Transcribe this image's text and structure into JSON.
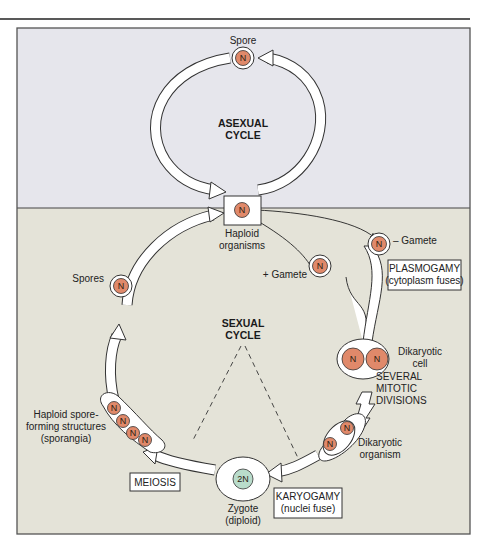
{
  "colors": {
    "asexual_bg": "#e6e6ec",
    "sexual_bg": "#e4e3d8",
    "nucleus_haploid": "#e0896a",
    "nucleus_diploid": "#b9dccb",
    "frame": "#444444"
  },
  "asexual": {
    "title_line1": "ASEXUAL",
    "title_line2": "CYCLE",
    "spore_label": "Spore",
    "spore_nucleus": "N"
  },
  "haploid": {
    "nucleus": "N",
    "label_line1": "Haploid",
    "label_line2": "organisms"
  },
  "gametes": {
    "minus_label": "– Gamete",
    "plus_label": "+ Gamete",
    "nucleus": "N"
  },
  "plasmogamy": {
    "title": "PLASMOGAMY",
    "subtitle": "(cytoplasm fuses)"
  },
  "dikaryotic_cell": {
    "nuclei": [
      "N",
      "N"
    ],
    "label_line1": "Dikaryotic",
    "label_line2": "cell"
  },
  "mitotic": {
    "line1": "SEVERAL",
    "line2": "MITOTIC",
    "line3": "DIVISIONS"
  },
  "dikaryotic_organism": {
    "nuclei": [
      "N",
      "N"
    ],
    "label_line1": "Dikaryotic",
    "label_line2": "organism"
  },
  "karyogamy": {
    "title": "KARYOGAMY",
    "subtitle": "(nuclei fuse)"
  },
  "zygote": {
    "nucleus": "2N",
    "label_line1": "Zygote",
    "label_line2": "(diploid)"
  },
  "meiosis": {
    "title": "MEIOSIS"
  },
  "sporangia": {
    "nuclei": [
      "N",
      "N",
      "N",
      "N"
    ],
    "label_line1": "Haploid spore-",
    "label_line2": "forming structures",
    "label_line3": "(sporangia)"
  },
  "spores": {
    "label": "Spores",
    "nucleus": "N"
  },
  "sexual": {
    "title_line1": "SEXUAL",
    "title_line2": "CYCLE"
  }
}
